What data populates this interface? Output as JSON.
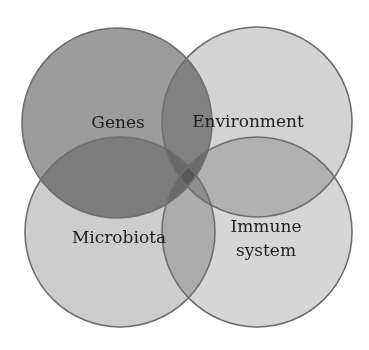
{
  "diagram": {
    "type": "venn",
    "sets": [
      {
        "id": "genes",
        "label_lines": [
          "Genes"
        ],
        "fill": "#9c9c9c"
      },
      {
        "id": "environment",
        "label_lines": [
          "Environment"
        ],
        "fill": "#d3d3d3"
      },
      {
        "id": "microbiota",
        "label_lines": [
          "Microbiota"
        ],
        "fill": "#cdcdcd"
      },
      {
        "id": "immune-system",
        "label_lines": [
          "Immune",
          "system"
        ],
        "fill": "#d6d6d6"
      }
    ],
    "outline_color": "#6e6e6e",
    "background": "#ffffff"
  },
  "labels": {
    "genes": "Genes",
    "environment": "Environment",
    "microbiota": "Microbiota",
    "immune_line1": "Immune",
    "immune_line2": "system"
  }
}
